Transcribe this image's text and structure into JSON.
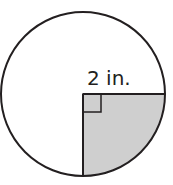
{
  "diagram": {
    "type": "circle-with-shaded-quarter",
    "radius_label": "2 in.",
    "shaded_region": "quarter circle (lower-right)",
    "right_angle_marker": true,
    "colors": {
      "stroke": "#231f20",
      "shade": "#cfcfcf",
      "background": "#ffffff"
    }
  }
}
